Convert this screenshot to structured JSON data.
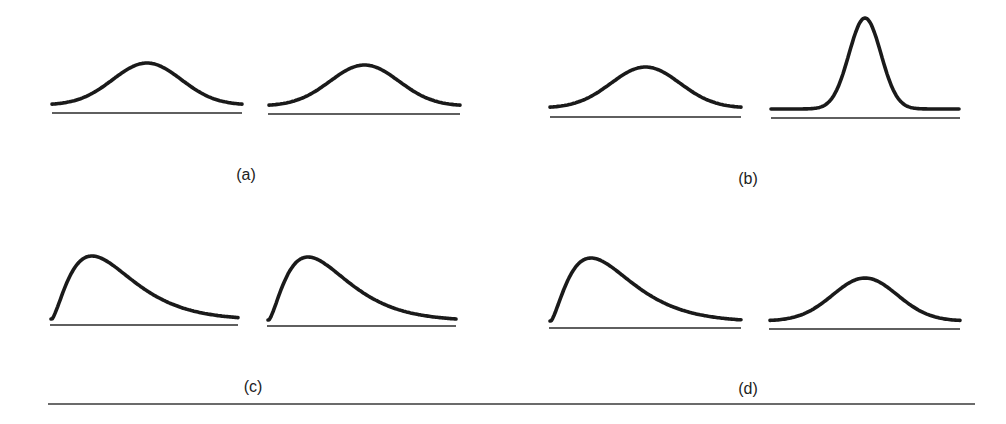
{
  "figure": {
    "panels": [
      {
        "label": "(a)",
        "left": {
          "shape": "symmetric-bell",
          "spread": "wide"
        },
        "right": {
          "shape": "symmetric-bell",
          "spread": "wide"
        },
        "comparison": "same shape, same spread"
      },
      {
        "label": "(b)",
        "left": {
          "shape": "symmetric-bell",
          "spread": "wide"
        },
        "right": {
          "shape": "symmetric-bell",
          "spread": "narrow-tall"
        },
        "comparison": "same center, different spread"
      },
      {
        "label": "(c)",
        "left": {
          "shape": "right-skewed"
        },
        "right": {
          "shape": "right-skewed"
        },
        "comparison": "same skewed shape"
      },
      {
        "label": "(d)",
        "left": {
          "shape": "right-skewed"
        },
        "right": {
          "shape": "symmetric-bell",
          "spread": "wide"
        },
        "comparison": "different shapes"
      }
    ]
  },
  "colors": {
    "stroke": "#1a1a1a",
    "background": "#ffffff"
  }
}
